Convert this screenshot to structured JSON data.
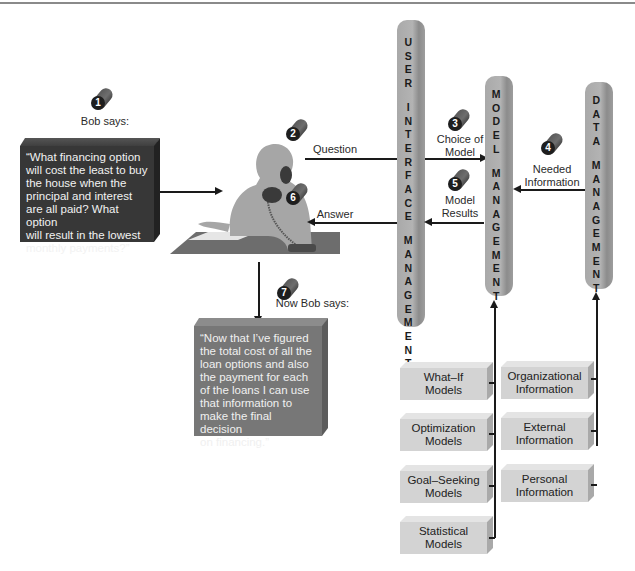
{
  "steps": {
    "s1": {
      "num": "1",
      "label": "Bob says:"
    },
    "s2": {
      "num": "2",
      "label": "Question"
    },
    "s3": {
      "num": "3",
      "label_line1": "Choice of",
      "label_line2": "Model"
    },
    "s4": {
      "num": "4",
      "label_line1": "Needed",
      "label_line2": "Information"
    },
    "s5": {
      "num": "5",
      "label_line1": "Model",
      "label_line2": "Results"
    },
    "s6": {
      "num": "6",
      "label": "Answer"
    },
    "s7": {
      "num": "7",
      "label": "Now Bob says:"
    }
  },
  "quotes": {
    "initial": [
      "“What financing option",
      "will cost the least to buy",
      "the house when the",
      "principal and interest",
      "are all paid? What option",
      "will result in the lowest",
      "monthly payments?”"
    ],
    "final": [
      "“Now that I’ve figured",
      "the total cost of all the",
      "loan options and also",
      "the payment for each",
      "of the loans I can use",
      "that information to",
      "make the final decision",
      "on financing.”"
    ]
  },
  "pillars": {
    "user_interface": {
      "word1": "USER",
      "word2": "INTERFACE",
      "word3": "MANAGEMENT"
    },
    "model": {
      "word1": "MODEL",
      "word2": "MANAGEMENT"
    },
    "data": {
      "word1": "DATA",
      "word2": "MANAGEMENT"
    }
  },
  "models": [
    {
      "line1": "What–If Models",
      "line2": ""
    },
    {
      "line1": "Optimization",
      "line2": "Models"
    },
    {
      "line1": "Goal–Seeking",
      "line2": "Models"
    },
    {
      "line1": "Statistical",
      "line2": "Models"
    }
  ],
  "information": [
    {
      "line1": "Organizational",
      "line2": "Information"
    },
    {
      "line1": "External",
      "line2": "Information"
    },
    {
      "line1": "Personal",
      "line2": "Information"
    }
  ],
  "figure": {
    "name": "person-on-phone-at-desk"
  },
  "colors": {
    "dark_box": "#373737",
    "mid_box": "#777777",
    "light_box": "#d3d3d3",
    "pillar": "#aaaaaa",
    "badge": "#5a5a5a"
  }
}
